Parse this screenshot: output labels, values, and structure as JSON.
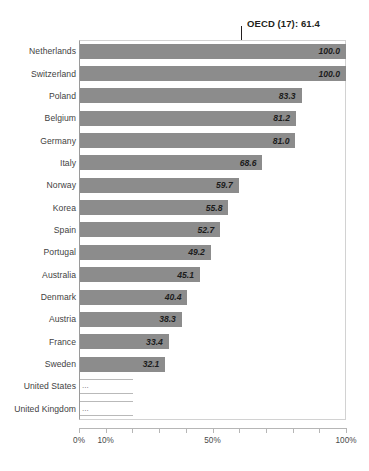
{
  "chart_data": {
    "type": "bar",
    "orientation": "horizontal",
    "title": "",
    "subtitle": "",
    "xlabel": "",
    "ylabel": "",
    "xlim": [
      0,
      100
    ],
    "grid": false,
    "legend": null,
    "value_suffix": "%",
    "bar_color": "#8c8c8c",
    "reference_line": {
      "label": "OECD (17): 61.4",
      "value": 61.4,
      "color": "#231f20"
    },
    "axis": {
      "ticks": [
        0,
        10,
        20,
        30,
        40,
        50,
        60,
        70,
        80,
        90,
        100
      ],
      "tick_labels": [
        "0%",
        "10%",
        "",
        "",
        "",
        "50%",
        "",
        "",
        "",
        "",
        "100%"
      ]
    },
    "categories": [
      "Netherlands",
      "Switzerland",
      "Poland",
      "Belgium",
      "Germany",
      "Italy",
      "Norway",
      "Korea",
      "Spain",
      "Portugal",
      "Australia",
      "Denmark",
      "Austria",
      "France",
      "Sweden",
      "United States",
      "United Kingdom"
    ],
    "values": [
      100.0,
      100.0,
      83.3,
      81.2,
      81.0,
      68.6,
      59.7,
      55.8,
      52.7,
      49.2,
      45.1,
      40.4,
      38.3,
      33.4,
      32.1,
      null,
      null
    ],
    "value_labels": [
      "100.0",
      "100.0",
      "83.3",
      "81.2",
      "81.0",
      "68.6",
      "59.7",
      "55.8",
      "52.7",
      "49.2",
      "45.1",
      "40.4",
      "38.3",
      "33.4",
      "32.1",
      "...",
      "..."
    ]
  }
}
